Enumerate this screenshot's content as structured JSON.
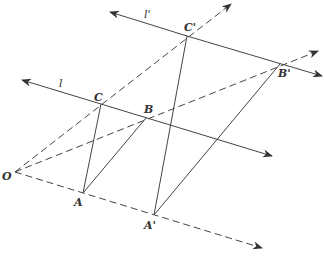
{
  "diagram": {
    "type": "geometry",
    "points": {
      "O": {
        "label": "O",
        "x": 15,
        "y": 172
      },
      "A": {
        "label": "A",
        "x": 83,
        "y": 193
      },
      "B": {
        "label": "B",
        "x": 146,
        "y": 118
      },
      "C": {
        "label": "C",
        "x": 101,
        "y": 104
      },
      "A_prime": {
        "label": "A'",
        "x": 154,
        "y": 215
      },
      "B_prime": {
        "label": "B'",
        "x": 280,
        "y": 64
      },
      "C_prime": {
        "label": "C'",
        "x": 187,
        "y": 36
      }
    },
    "lines": {
      "l": {
        "label": "l"
      },
      "l_prime": {
        "label": "l'"
      }
    },
    "colors": {
      "stroke": "#444444",
      "background": "#ffffff"
    }
  }
}
